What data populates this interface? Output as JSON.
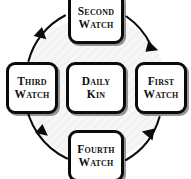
{
  "diagram": {
    "type": "cycle-diagram",
    "direction": "counterclockwise",
    "colors": {
      "stroke": "#0b0b0b",
      "box_fill": "#ffffff",
      "text": "#111111",
      "circle_fill": "#f4f4f4",
      "page_background": "#ffffff"
    },
    "center": {
      "id": "daily-kin",
      "line1": "Daily",
      "line2": "Kin"
    },
    "nodes": [
      {
        "id": "first-watch",
        "position": "right",
        "line1": "First",
        "line2": "Watch"
      },
      {
        "id": "second-watch",
        "position": "top",
        "line1": "Second",
        "line2": "Watch"
      },
      {
        "id": "third-watch",
        "position": "left",
        "line1": "Third",
        "line2": "Watch"
      },
      {
        "id": "fourth-watch",
        "position": "bottom",
        "line1": "Fourth",
        "line2": "Watch"
      }
    ],
    "arrows": [
      {
        "id": "arrow-lower-right",
        "from": "fourth-watch",
        "to": "first-watch",
        "quadrant": "lower-right"
      },
      {
        "id": "arrow-upper-right",
        "from": "first-watch",
        "to": "second-watch",
        "quadrant": "upper-right"
      },
      {
        "id": "arrow-upper-left",
        "from": "second-watch",
        "to": "third-watch",
        "quadrant": "upper-left"
      },
      {
        "id": "arrow-lower-left",
        "from": "third-watch",
        "to": "fourth-watch",
        "quadrant": "lower-left"
      }
    ]
  }
}
